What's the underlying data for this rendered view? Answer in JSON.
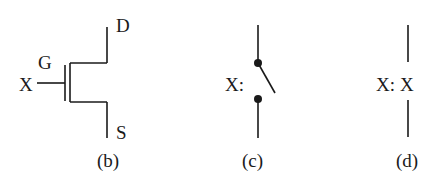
{
  "panels": [
    {
      "id": "b",
      "caption": "(b)",
      "type": "mosfet",
      "labels": {
        "drain": "D",
        "gate": "G",
        "source": "S",
        "input": "X"
      }
    },
    {
      "id": "c",
      "caption": "(c)",
      "type": "switch",
      "labels": {
        "control": "X:"
      }
    },
    {
      "id": "d",
      "caption": "(d)",
      "type": "wire-label",
      "labels": {
        "control": "X:",
        "value": "X"
      }
    }
  ],
  "colors": {
    "ink": "#1a1a1a",
    "background": "#ffffff"
  }
}
